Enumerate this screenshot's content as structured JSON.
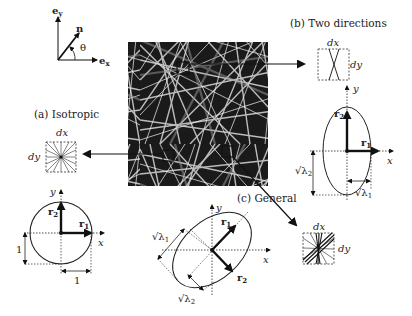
{
  "axes_legend": {
    "ey": "e",
    "ey_sub": "y",
    "ex": "e",
    "ex_sub": "x",
    "n": "n",
    "theta": "θ"
  },
  "panels": {
    "isotropic": {
      "title": "(a) Isotropic",
      "dx": "dx",
      "dy": "dy",
      "axis_x": "x",
      "axis_y": "y",
      "r1": "r",
      "r1_sub": "1",
      "r2": "r",
      "r2_sub": "2",
      "dim_v": "1",
      "dim_h": "1"
    },
    "two_directions": {
      "title": "(b) Two directions",
      "dx": "dx",
      "dy": "dy",
      "axis_x": "x",
      "axis_y": "y",
      "r1": "r",
      "r1_sub": "1",
      "r2": "r",
      "r2_sub": "2",
      "dim_v": "√λ",
      "dim_v_sub": "2",
      "dim_h": "√λ",
      "dim_h_sub": "1"
    },
    "general": {
      "title": "(c) General",
      "dx": "dx",
      "dy": "dy",
      "axis_x": "x",
      "axis_y": "y",
      "r1": "r",
      "r1_sub": "1",
      "r2": "r",
      "r2_sub": "2",
      "dim_1": "√λ",
      "dim_1_sub": "1",
      "dim_2": "√λ",
      "dim_2_sub": "2"
    }
  },
  "image": {
    "description": "fiber-network-micrograph"
  }
}
